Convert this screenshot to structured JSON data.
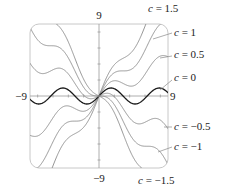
{
  "chart_data": {
    "type": "line",
    "title": "",
    "function": "y = c*x + sin(x)",
    "xlabel": "",
    "ylabel": "",
    "xlim": [
      -9,
      9
    ],
    "ylim": [
      -9,
      9
    ],
    "grid": false,
    "legend_position": "right (inline labels)",
    "tick_labels": {
      "x_min": "−9",
      "x_max": "9",
      "y_min": "−9",
      "y_max": "9"
    },
    "tick_interval": 2,
    "series": [
      {
        "name": "c = 1.5",
        "c": 1.5,
        "label": "= 1.5",
        "emphasis": false
      },
      {
        "name": "c = 1",
        "c": 1,
        "label": "= 1",
        "emphasis": false
      },
      {
        "name": "c = 0.5",
        "c": 0.5,
        "label": "= 0.5",
        "emphasis": false
      },
      {
        "name": "c = 0",
        "c": 0,
        "label": "= 0",
        "emphasis": true
      },
      {
        "name": "c = −0.5",
        "c": -0.5,
        "label": "= −0.5",
        "emphasis": false
      },
      {
        "name": "c = −1",
        "c": -1,
        "label": "= −1",
        "emphasis": false
      },
      {
        "name": "c = −1.5",
        "c": -1.5,
        "label": "= −1.5",
        "emphasis": false
      }
    ],
    "colors": {
      "curve": "#8a8a8a",
      "emphasis_curve": "#1a1a1a",
      "axis": "#9a9a9a",
      "frame": "#c8c8c8",
      "text": "#222222"
    }
  },
  "labels": {
    "c_symbol": "c"
  }
}
